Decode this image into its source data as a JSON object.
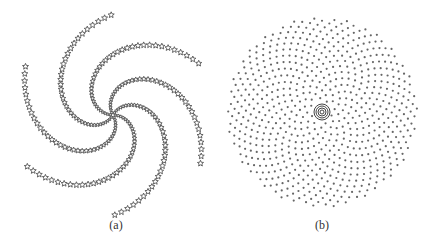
{
  "figure": {
    "panels": [
      {
        "id": "a",
        "caption": "(a)",
        "description": "Spiral arms of star markers",
        "marker": "star-outline",
        "color": "#555555",
        "center": [
          113,
          115
        ],
        "arms": 6,
        "points_per_arm": 38,
        "max_radius": 100,
        "twist": 2.6
      },
      {
        "id": "b",
        "caption": "(b)",
        "description": "Phyllotaxis (sunflower) dot pattern",
        "marker": "dot",
        "color": "#666666",
        "center": [
          107,
          112
        ],
        "points": 700,
        "max_radius": 95,
        "center_rings": [
          2,
          4,
          6,
          8
        ]
      }
    ]
  }
}
